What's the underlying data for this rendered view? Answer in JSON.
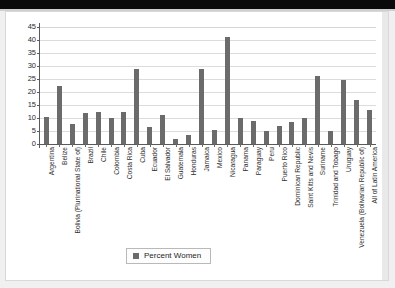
{
  "chart_data": {
    "type": "bar",
    "title": "",
    "xlabel": "",
    "ylabel": "",
    "ylim": [
      0,
      45
    ],
    "ytick_step": 5,
    "yticks": [
      45,
      40,
      35,
      30,
      25,
      20,
      15,
      10,
      5,
      0
    ],
    "grid": true,
    "legend_position": "bottom-center",
    "series_name": "Percent Women",
    "bar_color": "#6b6b6b",
    "categories": [
      "Argentina",
      "Belize",
      "Bolivia (Plurinational State of)",
      "Brazil",
      "Chile",
      "Colombia",
      "Costa Rica",
      "Cuba",
      "Ecuador",
      "El Salvador",
      "Guatemala",
      "Honduras",
      "Jamaica",
      "Mexico",
      "Nicaragua",
      "Panama",
      "Paraguay",
      "Peru",
      "Puerto Rico",
      "Dominican Republic",
      "Saint Kitts and Nevis",
      "Suriname",
      "Trinidad and Tobago",
      "Uruguay",
      "Venezuela (Bolivarian Republic of)",
      "All of Latin America"
    ],
    "values": [
      10.2,
      22.2,
      7.7,
      12.0,
      12.4,
      10.0,
      12.5,
      29.0,
      6.4,
      11.0,
      2.1,
      3.4,
      29.0,
      5.3,
      41.0,
      10.0,
      8.8,
      5.0,
      7.0,
      8.5,
      10.0,
      26.0,
      5.0,
      24.5,
      17.0,
      13.0
    ]
  },
  "legend": {
    "label": "Percent Women"
  }
}
